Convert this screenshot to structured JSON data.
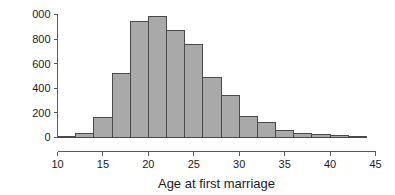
{
  "chart_data": {
    "type": "bar",
    "title": "",
    "subtitle": "",
    "xlabel": "Age at first marriage",
    "ylabel": "",
    "grid": false,
    "legend": null,
    "bin_width": 2,
    "bin_edges": [
      10,
      12,
      14,
      16,
      18,
      20,
      22,
      24,
      26,
      28,
      30,
      32,
      34,
      36,
      38,
      40,
      42,
      44
    ],
    "categories": [
      "10-12",
      "12-14",
      "14-16",
      "16-18",
      "18-20",
      "20-22",
      "22-24",
      "24-26",
      "26-28",
      "28-30",
      "30-32",
      "32-34",
      "34-36",
      "36-38",
      "38-40",
      "40-42",
      "42-44"
    ],
    "values": [
      5,
      30,
      160,
      520,
      945,
      980,
      870,
      760,
      490,
      345,
      170,
      125,
      60,
      35,
      22,
      15,
      5
    ],
    "xlim": [
      10,
      45
    ],
    "ylim": [
      0,
      1000
    ],
    "xticks": [
      10,
      15,
      20,
      25,
      30,
      35,
      40,
      45
    ],
    "xtick_labels": [
      "10",
      "15",
      "20",
      "25",
      "30",
      "35",
      "40",
      "45"
    ],
    "yticks": [
      0,
      200,
      400,
      600,
      800,
      1000
    ],
    "ytick_labels": [
      "0",
      "200",
      "400",
      "600",
      "800",
      "000"
    ],
    "bar_fill_color": "#a9a9a9",
    "bar_edge_color": "#4a4a4a",
    "axis_color": "#5a5a5a",
    "text_color": "#1a1a1a",
    "background_color": "#ffffff"
  }
}
